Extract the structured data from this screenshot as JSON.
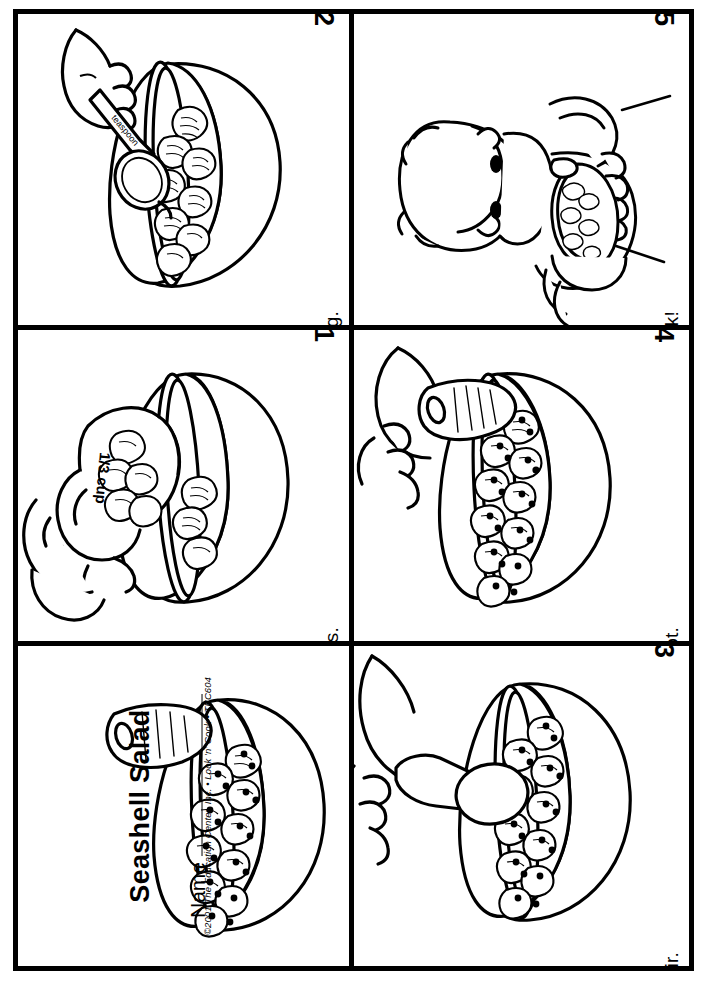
{
  "worksheet": {
    "title": "Seashell Salad",
    "name_label": "Name",
    "copyright": "©2001 The Education Center, Inc. • Look 'n' Cook • TEC604"
  },
  "panels": [
    {
      "id": "title-panel",
      "number": "",
      "caption": "",
      "art": "bowl-with-shells-and-carrot",
      "art_labels": []
    },
    {
      "id": "step-1",
      "number": "1",
      "caption": "Measure the shells.",
      "art": "hand-pouring-measuring-cup-into-bowl",
      "art_labels": [
        "1/3 cup"
      ]
    },
    {
      "id": "step-2",
      "number": "2",
      "caption": "Add 1 teaspoon of dressing.",
      "art": "hand-holding-teaspoon-over-bowl",
      "art_labels": [
        "teaspoon"
      ]
    },
    {
      "id": "step-3",
      "number": "3",
      "caption": "Stir.",
      "art": "hand-stirring-bowl-with-spoon",
      "art_labels": []
    },
    {
      "id": "step-4",
      "number": "4",
      "caption": "Add a carrot.",
      "art": "hand-adding-carrot-to-bowl",
      "art_labels": []
    },
    {
      "id": "step-5",
      "number": "5",
      "caption": "Seashells for snack!",
      "art": "child-eating-bowl-of-seashell-salad",
      "art_labels": []
    }
  ],
  "colors": {
    "ink": "#000000",
    "paper": "#ffffff"
  }
}
